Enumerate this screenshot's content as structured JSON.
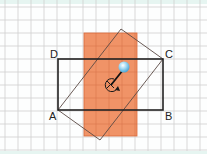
{
  "diagram": {
    "grid": {
      "spacing": 13,
      "color": "#c9c9c9"
    },
    "colors": {
      "orange_fill": "#ef8a5a",
      "orange_stroke": "#d9693a",
      "rect_stroke": "#222222",
      "rotated_stroke": "#555555",
      "ball": "#8fd0f0"
    },
    "labels": {
      "A": "A",
      "B": "B",
      "C": "C",
      "D": "D"
    },
    "rotation_symbol": "rotation-about-center"
  }
}
